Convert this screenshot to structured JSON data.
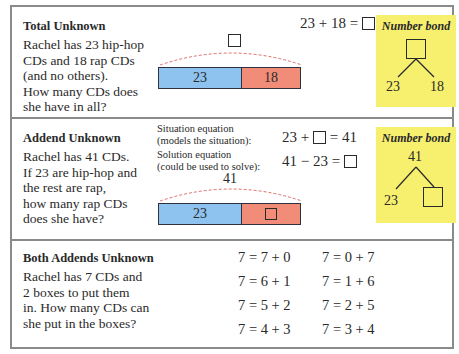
{
  "rows": [
    {
      "title": "Total Unknown",
      "story": [
        "Rachel has 23 hip-hop",
        "CDs and 18 rap CDs",
        "(and no others).",
        "How many CDs does",
        "she have in all?"
      ],
      "equation": {
        "left": "23 + 18 =",
        "unknown": "box"
      },
      "tape": {
        "total_label": "box",
        "parts": [
          "23",
          "18"
        ]
      },
      "number_bond": {
        "title": "Number bond",
        "top": "box",
        "left": "23",
        "right": "18"
      }
    },
    {
      "title": "Addend Unknown",
      "story": [
        "Rachel has 41 CDs.",
        "If 23 are hip-hop and",
        "the rest are rap,",
        "how many rap CDs",
        "does she have?"
      ],
      "situation_label": [
        "Situation equation",
        "(models the situation):"
      ],
      "situation_equation": {
        "left": "23 +",
        "right": "= 41"
      },
      "solution_label": [
        "Solution equation",
        "(could be used to solve):"
      ],
      "solution_equation": {
        "left": "41 − 23 ="
      },
      "tape": {
        "total_label": "41",
        "parts": [
          "23",
          "box"
        ]
      },
      "number_bond": {
        "title": "Number bond",
        "top": "41",
        "left": "23",
        "right": "box"
      }
    },
    {
      "title": "Both Addends Unknown",
      "story": [
        "Rachel has 7 CDs and",
        "2 boxes to put them",
        "in. How many CDs can",
        "she put in the boxes?"
      ],
      "equations_left": [
        "7 = 7 + 0",
        "7 = 6 + 1",
        "7 = 5 + 2",
        "7 = 4 + 3"
      ],
      "equations_right": [
        "7 = 0 + 7",
        "7 = 1 + 6",
        "7 = 2 + 5",
        "7 = 3 + 4"
      ]
    }
  ],
  "colors": {
    "blue": "#8ec2ef",
    "red": "#f08c78",
    "bond_bg": "#f7ef6e",
    "border": "#8a8a8a",
    "arc": "#e07070"
  }
}
